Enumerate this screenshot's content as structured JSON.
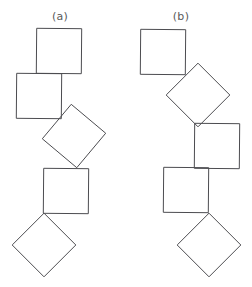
{
  "figure": {
    "type": "diagram",
    "title_visible": false,
    "background_color": "#ffffff",
    "stroke_color": "#4c4c50",
    "fill_color": "none",
    "stroke_width": 1,
    "width": 252,
    "height": 287,
    "description_visible_text": [
      "(a)",
      "(b)"
    ]
  },
  "panels": [
    {
      "id": "panel-a",
      "label": "(a)",
      "label_x": 60,
      "label_y": 10,
      "shape_count": 5,
      "shapes": [
        {
          "name": "square-a1",
          "cx": 59,
          "cy": 51,
          "size": 45,
          "angle": 0.5
        },
        {
          "name": "square-a2",
          "cx": 39,
          "cy": 96,
          "size": 45,
          "angle": 0.5
        },
        {
          "name": "square-a3",
          "cx": 74,
          "cy": 136,
          "size": 45,
          "angle": 40
        },
        {
          "name": "square-a4",
          "cx": 66,
          "cy": 191,
          "size": 45,
          "angle": 0.5
        },
        {
          "name": "square-a5",
          "cx": 44,
          "cy": 245,
          "size": 45,
          "angle": 45
        }
      ]
    },
    {
      "id": "panel-b",
      "label": "(b)",
      "label_x": 181,
      "label_y": 10,
      "shape_count": 5,
      "shapes": [
        {
          "name": "square-b1",
          "cx": 163,
          "cy": 52,
          "size": 45,
          "angle": 0.5
        },
        {
          "name": "square-b2",
          "cx": 198,
          "cy": 95,
          "size": 45,
          "angle": 45
        },
        {
          "name": "square-b3",
          "cx": 217,
          "cy": 146,
          "size": 45,
          "angle": 0.5
        },
        {
          "name": "square-b4",
          "cx": 186,
          "cy": 190,
          "size": 45,
          "angle": 0.5
        },
        {
          "name": "square-b5",
          "cx": 209,
          "cy": 245,
          "size": 45,
          "angle": 45
        }
      ]
    }
  ]
}
